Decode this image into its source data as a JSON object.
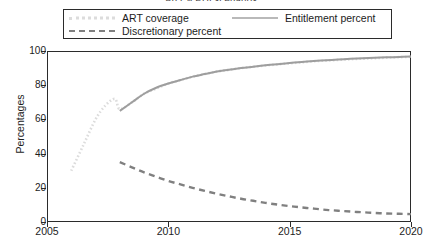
{
  "chart_data": {
    "type": "line",
    "title": "ART и PHI scenarios",
    "xlabel": "",
    "ylabel": "Percentages",
    "xlim": [
      2005,
      2020
    ],
    "ylim": [
      0,
      100
    ],
    "xticks": [
      2005,
      2010,
      2015,
      2020
    ],
    "yticks": [
      0,
      20,
      40,
      60,
      80,
      100
    ],
    "grid": false,
    "legend_position": "top",
    "series": [
      {
        "name": "ART coverage",
        "style": "dotted",
        "color": "#dcdcdc",
        "x": [
          2006,
          2006.5,
          2007,
          2007.4,
          2007.8,
          2008,
          2008.5,
          2009,
          2009.5,
          2010,
          2010.5,
          2011,
          2011.5,
          2012,
          2012.5,
          2013,
          2013.5,
          2014,
          2014.5,
          2015,
          2015.5,
          2016,
          2016.5,
          2017,
          2017.5,
          2018,
          2018.5,
          2019,
          2019.5,
          2020
        ],
        "y": [
          30,
          45,
          60,
          68,
          72,
          66,
          70,
          75,
          78,
          81,
          83,
          85,
          86.5,
          88,
          89,
          90,
          90.8,
          91.5,
          92.2,
          92.8,
          93.4,
          94,
          94.4,
          94.8,
          95.2,
          95.5,
          95.8,
          96.1,
          96.4,
          96.6
        ]
      },
      {
        "name": "Entitlement percent",
        "style": "solid",
        "color": "#9e9e9e",
        "x": [
          2008,
          2008.5,
          2009,
          2009.5,
          2010,
          2010.5,
          2011,
          2011.5,
          2012,
          2012.5,
          2013,
          2013.5,
          2014,
          2014.5,
          2015,
          2015.5,
          2016,
          2016.5,
          2017,
          2017.5,
          2018,
          2018.5,
          2019,
          2019.5,
          2020
        ],
        "y": [
          65,
          70,
          75,
          78.5,
          81,
          83,
          85,
          86.5,
          88,
          89,
          90,
          90.8,
          91.6,
          92.3,
          93,
          93.6,
          94.1,
          94.6,
          95,
          95.4,
          95.7,
          96,
          96.3,
          96.5,
          96.8
        ]
      },
      {
        "name": "Discretionary percent",
        "style": "dashed",
        "color": "#808080",
        "x": [
          2008,
          2008.5,
          2009,
          2009.5,
          2010,
          2010.5,
          2011,
          2011.5,
          2012,
          2012.5,
          2013,
          2013.5,
          2014,
          2014.5,
          2015,
          2015.5,
          2016,
          2016.5,
          2017,
          2017.5,
          2018,
          2018.5,
          2019,
          2019.5,
          2020
        ],
        "y": [
          35,
          32,
          29,
          26.5,
          24,
          22,
          20,
          18.2,
          16.5,
          15,
          13.6,
          12.4,
          11.2,
          10.2,
          9.3,
          8.5,
          7.8,
          7.1,
          6.6,
          6.1,
          5.7,
          5.3,
          5.0,
          4.8,
          4.6
        ]
      }
    ]
  },
  "legend": {
    "items": [
      {
        "label": "ART coverage"
      },
      {
        "label": "Entitlement percent"
      },
      {
        "label": "Discretionary percent"
      }
    ]
  },
  "axes": {
    "y_title": "Percentages",
    "y_ticks": [
      "100",
      "80",
      "60",
      "40",
      "20",
      "0"
    ],
    "x_ticks": [
      "2005",
      "2010",
      "2015",
      "2020"
    ]
  }
}
